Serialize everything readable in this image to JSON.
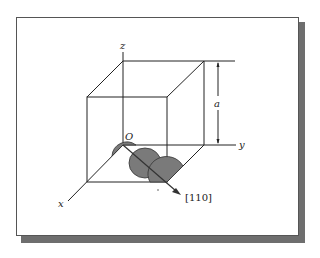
{
  "figure": {
    "type": "unit-cell-diagram",
    "labels": {
      "z_axis": "z",
      "y_axis": "y",
      "x_axis": "x",
      "origin": "O",
      "lattice_param": "a",
      "direction": "[110]"
    },
    "colors": {
      "line": "#222222",
      "atom_fill": "#7a7a7a",
      "atom_stroke": "#333333",
      "frame_shadow": "#6e6e6e"
    }
  }
}
